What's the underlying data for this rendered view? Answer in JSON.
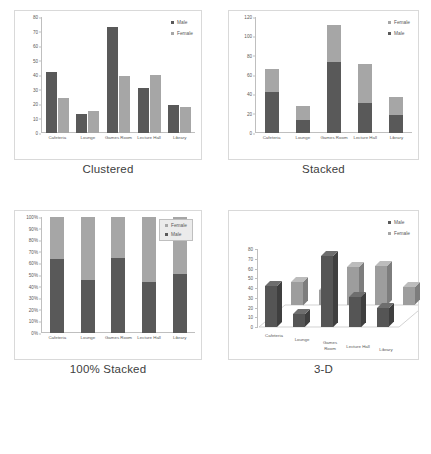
{
  "figure": {
    "categories": [
      "Cafeteria",
      "Lounge",
      "Games Room",
      "Lecture Hall",
      "Library"
    ],
    "series_male": "Male",
    "series_female": "Female",
    "colors": {
      "male": "#595959",
      "female": "#a6a6a6",
      "panel_border": "#d9d9d9",
      "axis": "#bfbfbf"
    }
  },
  "panels": [
    {
      "caption": "Clustered",
      "chart_data": {
        "type": "bar",
        "title": "Clustered",
        "categories": [
          "Cafeteria",
          "Lounge",
          "Games Room",
          "Lecture Hall",
          "Library"
        ],
        "series": [
          {
            "name": "Male",
            "values": [
              42,
              13,
              73,
              31,
              19
            ],
            "color": "#595959"
          },
          {
            "name": "Female",
            "values": [
              24,
              15,
              39,
              40,
              18
            ],
            "color": "#a6a6a6"
          }
        ],
        "xlabel": "",
        "ylabel": "",
        "ylim": [
          0,
          80
        ],
        "yticks": [
          "0",
          "10",
          "20",
          "30",
          "40",
          "50",
          "60",
          "70",
          "80"
        ],
        "grid": false,
        "legend": [
          "Male",
          "Female"
        ],
        "legend_position": "top-right"
      }
    },
    {
      "caption": "Stacked",
      "chart_data": {
        "type": "bar",
        "title": "Stacked",
        "stacked": true,
        "categories": [
          "Cafeteria",
          "Lounge",
          "Games Room",
          "Lecture Hall",
          "Library"
        ],
        "series": [
          {
            "name": "Male",
            "values": [
              42,
              13,
              73,
              31,
              19
            ],
            "color": "#595959"
          },
          {
            "name": "Female",
            "values": [
              24,
              15,
              39,
              40,
              18
            ],
            "color": "#a6a6a6"
          }
        ],
        "totals": [
          66,
          28,
          112,
          71,
          37
        ],
        "xlabel": "",
        "ylabel": "",
        "ylim": [
          0,
          120
        ],
        "yticks": [
          "0",
          "20",
          "40",
          "60",
          "80",
          "100",
          "120"
        ],
        "grid": false,
        "legend": [
          "Female",
          "Male"
        ],
        "legend_position": "top-right"
      }
    },
    {
      "caption": "100% Stacked",
      "chart_data": {
        "type": "bar",
        "title": "100% Stacked",
        "stacked": true,
        "normalized": true,
        "categories": [
          "Cafeteria",
          "Lounge",
          "Games Room",
          "Lecture Hall",
          "Library"
        ],
        "series": [
          {
            "name": "Male",
            "values": [
              64,
              46,
              65,
              44,
              51
            ],
            "color": "#595959"
          },
          {
            "name": "Female",
            "values": [
              36,
              54,
              35,
              56,
              49
            ],
            "color": "#a6a6a6"
          }
        ],
        "xlabel": "",
        "ylabel": "",
        "ylim": [
          0,
          100
        ],
        "yticks": [
          "0%",
          "10%",
          "20%",
          "30%",
          "40%",
          "50%",
          "60%",
          "70%",
          "80%",
          "90%",
          "100%"
        ],
        "grid": false,
        "legend": [
          "Female",
          "Male"
        ],
        "legend_position": "top-right-boxed"
      }
    },
    {
      "caption": "3-D",
      "chart_data": {
        "type": "bar",
        "title": "3-D",
        "three_d": true,
        "categories": [
          "Cafeteria",
          "Lounge",
          "Games Room",
          "Lecture Hall",
          "Library"
        ],
        "series": [
          {
            "name": "Male",
            "values": [
              42,
              13,
              73,
              31,
              19
            ],
            "color": "#595959"
          },
          {
            "name": "Female",
            "values": [
              24,
              15,
              39,
              40,
              18
            ],
            "color": "#a6a6a6"
          }
        ],
        "xlabel": "",
        "ylabel": "",
        "zlabel": "",
        "ylim": [
          0,
          80
        ],
        "yticks": [
          "0",
          "10",
          "20",
          "30",
          "40",
          "50",
          "60",
          "70",
          "80"
        ],
        "grid": false,
        "legend": [
          "Male",
          "Female"
        ],
        "legend_position": "top-right"
      }
    }
  ]
}
